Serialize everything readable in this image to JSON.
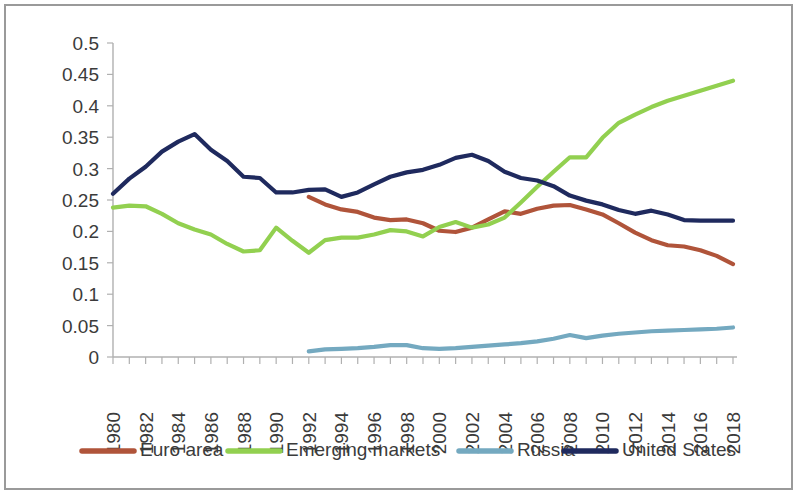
{
  "chart_data": {
    "type": "line",
    "title": "",
    "subtitle": "",
    "xlabel": "",
    "ylabel": "",
    "xlim": [
      1980,
      2018
    ],
    "ylim": [
      0,
      0.5
    ],
    "grid": false,
    "legend_position": "bottom",
    "y_ticks": [
      "0",
      "0.05",
      "0.1",
      "0.15",
      "0.2",
      "0.25",
      "0.3",
      "0.35",
      "0.4",
      "0.45",
      "0.5"
    ],
    "y_tick_values": [
      0,
      0.05,
      0.1,
      0.15,
      0.2,
      0.25,
      0.3,
      0.35,
      0.4,
      0.45,
      0.5
    ],
    "x_tick_labels": [
      "1980",
      "1982",
      "1984",
      "1986",
      "1988",
      "1990",
      "1992",
      "1994",
      "1996",
      "1998",
      "2000",
      "2002",
      "2004",
      "2006",
      "2008",
      "2010",
      "2012",
      "2014",
      "2016",
      "2018"
    ],
    "x_tick_values": [
      1980,
      1982,
      1984,
      1986,
      1988,
      1990,
      1992,
      1994,
      1996,
      1998,
      2000,
      2002,
      2004,
      2006,
      2008,
      2010,
      2012,
      2014,
      2016,
      2018
    ],
    "x": [
      1980,
      1981,
      1982,
      1983,
      1984,
      1985,
      1986,
      1987,
      1988,
      1989,
      1990,
      1991,
      1992,
      1993,
      1994,
      1995,
      1996,
      1997,
      1998,
      1999,
      2000,
      2001,
      2002,
      2003,
      2004,
      2005,
      2006,
      2007,
      2008,
      2009,
      2010,
      2011,
      2012,
      2013,
      2014,
      2015,
      2016,
      2017,
      2018
    ],
    "series": [
      {
        "name": "Euro area",
        "color": "#b0543a",
        "x": [
          1992,
          1993,
          1994,
          1995,
          1996,
          1997,
          1998,
          1999,
          2000,
          2001,
          2002,
          2003,
          2004,
          2005,
          2006,
          2007,
          2008,
          2009,
          2010,
          2011,
          2012,
          2013,
          2014,
          2015,
          2016,
          2017,
          2018
        ],
        "values": [
          0.255,
          0.243,
          0.235,
          0.231,
          0.222,
          0.218,
          0.219,
          0.213,
          0.201,
          0.199,
          0.206,
          0.219,
          0.232,
          0.228,
          0.236,
          0.241,
          0.242,
          0.235,
          0.227,
          0.213,
          0.198,
          0.186,
          0.178,
          0.176,
          0.17,
          0.161,
          0.148
        ]
      },
      {
        "name": "Emerging markets",
        "color": "#92d050",
        "x": [
          1980,
          1981,
          1982,
          1983,
          1984,
          1985,
          1986,
          1987,
          1988,
          1989,
          1990,
          1991,
          1992,
          1993,
          1994,
          1995,
          1996,
          1997,
          1998,
          1999,
          2000,
          2001,
          2002,
          2003,
          2004,
          2005,
          2006,
          2007,
          2008,
          2009,
          2010,
          2011,
          2012,
          2013,
          2014,
          2015,
          2016,
          2017,
          2018
        ],
        "values": [
          0.238,
          0.241,
          0.24,
          0.228,
          0.213,
          0.203,
          0.195,
          0.18,
          0.168,
          0.17,
          0.206,
          0.185,
          0.166,
          0.186,
          0.19,
          0.19,
          0.195,
          0.202,
          0.2,
          0.192,
          0.207,
          0.215,
          0.206,
          0.211,
          0.222,
          0.246,
          0.271,
          0.295,
          0.318,
          0.318,
          0.349,
          0.373,
          0.386,
          0.398,
          0.408,
          0.416,
          0.424,
          0.432,
          0.44
        ]
      },
      {
        "name": "Russia",
        "color": "#74a9c0",
        "x": [
          1992,
          1993,
          1994,
          1995,
          1996,
          1997,
          1998,
          1999,
          2000,
          2001,
          2002,
          2003,
          2004,
          2005,
          2006,
          2007,
          2008,
          2009,
          2010,
          2011,
          2012,
          2013,
          2014,
          2015,
          2016,
          2017,
          2018
        ],
        "values": [
          0.009,
          0.012,
          0.013,
          0.014,
          0.016,
          0.019,
          0.019,
          0.014,
          0.013,
          0.014,
          0.016,
          0.018,
          0.02,
          0.022,
          0.025,
          0.029,
          0.035,
          0.03,
          0.034,
          0.037,
          0.039,
          0.041,
          0.042,
          0.043,
          0.044,
          0.045,
          0.047
        ]
      },
      {
        "name": "United States",
        "color": "#1f2a5e",
        "x": [
          1980,
          1981,
          1982,
          1983,
          1984,
          1985,
          1986,
          1987,
          1988,
          1989,
          1990,
          1991,
          1992,
          1993,
          1994,
          1995,
          1996,
          1997,
          1998,
          1999,
          2000,
          2001,
          2002,
          2003,
          2004,
          2005,
          2006,
          2007,
          2008,
          2009,
          2010,
          2011,
          2012,
          2013,
          2014,
          2015,
          2016,
          2017,
          2018
        ],
        "values": [
          0.26,
          0.284,
          0.303,
          0.327,
          0.343,
          0.355,
          0.33,
          0.312,
          0.287,
          0.285,
          0.262,
          0.262,
          0.266,
          0.267,
          0.255,
          0.262,
          0.275,
          0.287,
          0.294,
          0.298,
          0.306,
          0.317,
          0.322,
          0.312,
          0.295,
          0.285,
          0.281,
          0.272,
          0.257,
          0.249,
          0.243,
          0.234,
          0.228,
          0.233,
          0.227,
          0.218,
          0.217,
          0.217,
          0.217
        ]
      }
    ]
  },
  "legend": {
    "items": [
      {
        "label": "Euro area",
        "color": "#b0543a"
      },
      {
        "label": "Emerging markets",
        "color": "#92d050"
      },
      {
        "label": "Russia",
        "color": "#74a9c0"
      },
      {
        "label": "United States",
        "color": "#1f2a5e"
      }
    ]
  }
}
